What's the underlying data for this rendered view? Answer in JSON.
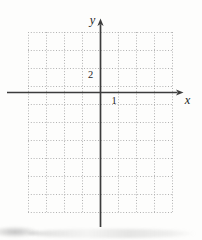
{
  "figure": {
    "x_axis_label": "x",
    "y_axis_label": "y",
    "x_tick_label": "1",
    "y_tick_label": "2"
  },
  "chart_data": {
    "type": "scatter",
    "title": "",
    "xlabel": "x",
    "ylabel": "y",
    "series": [],
    "points": [],
    "x_ticks": [
      {
        "value": 1,
        "label": "1"
      }
    ],
    "y_ticks": [
      {
        "value": 2,
        "label": "2"
      }
    ],
    "x_grid_step": 1,
    "y_grid_step": 2,
    "xlim": [
      -4,
      4
    ],
    "ylim": [
      -13,
      7
    ],
    "grid": "dotted",
    "legend": "none"
  },
  "colors": {
    "paper": "#fdfdfc",
    "gridline": "#b2b2b2",
    "axis": "#3c3c3c",
    "label": "#262626"
  }
}
